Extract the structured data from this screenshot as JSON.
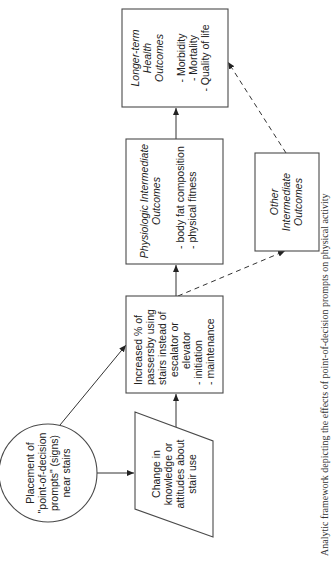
{
  "diagram": {
    "caption": "Analytic framework depicting the effects of point-of-decision prompts on physical activity",
    "nodes": {
      "placement": {
        "shape": "circle",
        "lines": [
          "Placement of",
          "\"point-of-decision",
          "prompts\" (signs)",
          "near stairs"
        ]
      },
      "change": {
        "shape": "parallelogram",
        "lines": [
          "Change in",
          "knowledge or",
          "attitudes about",
          "stair use"
        ]
      },
      "increased": {
        "shape": "rectangle",
        "lines": [
          "Increased % of",
          "passersby using",
          "stairs instead of",
          "escalator or",
          "elevator"
        ],
        "bullets": [
          "- initiation",
          "- maintenance"
        ]
      },
      "physiologic": {
        "shape": "rectangle",
        "title_lines": [
          "Physiologic Intermediate",
          "Outcomes"
        ],
        "bullets": [
          "- body fat composition",
          "- physical fitness"
        ]
      },
      "other": {
        "shape": "rectangle",
        "title_lines": [
          "Other",
          "Intermediate",
          "Outcomes"
        ]
      },
      "longterm": {
        "shape": "rectangle",
        "title_lines": [
          "Longer-term",
          "Health",
          "Outcomes"
        ],
        "bullets": [
          "- Morbidity",
          "- Mortality",
          "- Quality of life"
        ]
      }
    },
    "edges": [
      {
        "from": "placement",
        "to": "change",
        "style": "solid"
      },
      {
        "from": "placement",
        "to": "increased",
        "style": "solid"
      },
      {
        "from": "change",
        "to": "increased",
        "style": "solid"
      },
      {
        "from": "increased",
        "to": "physiologic",
        "style": "solid"
      },
      {
        "from": "increased",
        "to": "other",
        "style": "dashed"
      },
      {
        "from": "physiologic",
        "to": "longterm",
        "style": "solid"
      },
      {
        "from": "other",
        "to": "longterm",
        "style": "dashed"
      }
    ],
    "orientation": "rotated 90° counter-clockwise"
  }
}
